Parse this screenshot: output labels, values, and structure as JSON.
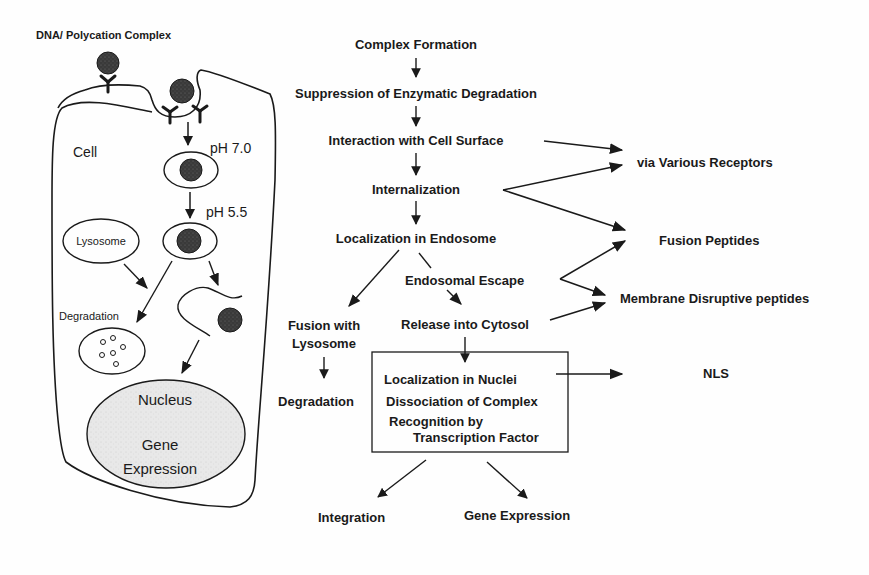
{
  "colors": {
    "ink": "#1a1a1a",
    "complex_fill": "#3a3a3a",
    "nucleus_fill": "#e6e6e6",
    "background": "#fefefe"
  },
  "cell_panel": {
    "complex_label": "DNA/ Polycation Complex",
    "cell_label": "Cell",
    "ph_early": "pH 7.0",
    "ph_late": "pH 5.5",
    "lysosome_label": "Lysosome",
    "degradation_label": "Degradation",
    "nucleus_label": "Nucleus",
    "gene_label": "Gene",
    "expression_label": "Expression"
  },
  "flow": {
    "steps": [
      "Complex Formation",
      "Suppression of Enzymatic Degradation",
      "Interaction with Cell Surface",
      "Internalization",
      "Localization in Endosome"
    ],
    "endosomal_escape": "Endosomal  Escape",
    "release": "Release into Cytosol",
    "fusion_line1": "Fusion with",
    "fusion_line2": "Lysosome",
    "fusion_degradation": "Degradation",
    "nuclear_box": {
      "line1": "Localization in Nuclei",
      "line2": "Dissociation of Complex",
      "line3": "Recognition by",
      "line4": "Transcription Factor"
    },
    "integration": "Integration",
    "gene_expression": "Gene Expression"
  },
  "strategies": {
    "receptors": "via Various Receptors",
    "fusion_peptides": "Fusion Peptides",
    "membrane_peptides": "Membrane Disruptive peptides",
    "nls": "NLS"
  }
}
